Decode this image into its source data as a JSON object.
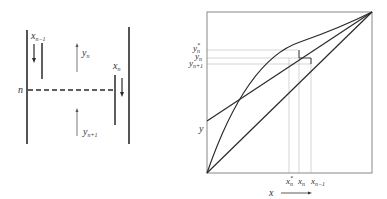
{
  "left_panel": {
    "labels": {
      "x_prev": "x",
      "x_prev_sub": "n−1",
      "y_n": "y",
      "y_n_sub": "n",
      "x_n": "x",
      "x_n_sub": "n",
      "stage": "n",
      "y_next": "y",
      "y_next_sub": "n+1"
    }
  },
  "right_panel": {
    "y_ticks": [
      {
        "base": "y",
        "sup": "*",
        "sub": "n"
      },
      {
        "base": "y",
        "sup": "",
        "sub": "n"
      },
      {
        "base": "y",
        "sup": "",
        "sub": "n+1"
      }
    ],
    "x_ticks": [
      {
        "base": "x",
        "sup": "*",
        "sub": "n"
      },
      {
        "base": "x",
        "sup": "",
        "sub": "n"
      },
      {
        "base": "x",
        "sup": "",
        "sub": "n−1"
      }
    ],
    "x_axis_label": "x",
    "y_axis_label": "y",
    "curves": [
      "equilibrium curve",
      "operating line",
      "diagonal y=x"
    ]
  },
  "colors": {
    "line": "#2a2a2a",
    "guide": "#bbbbbb"
  }
}
